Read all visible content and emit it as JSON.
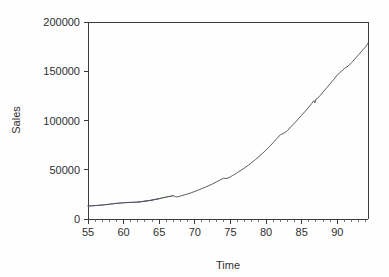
{
  "chart_data": {
    "type": "line",
    "title": "",
    "xlabel": "Time",
    "ylabel": "Sales",
    "xlim": [
      55,
      94.3
    ],
    "ylim": [
      0,
      200000
    ],
    "grid": false,
    "legend": "none",
    "x_ticks": [
      55,
      60,
      65,
      70,
      75,
      80,
      85,
      90
    ],
    "x_tick_labels": [
      "55",
      "60",
      "65",
      "70",
      "75",
      "80",
      "85",
      "90"
    ],
    "x_minor_tick_step": 1,
    "y_ticks": [
      0,
      50000,
      100000,
      150000,
      200000
    ],
    "y_tick_labels": [
      "0",
      "50000",
      "100000",
      "150000",
      "200000"
    ],
    "series": [
      {
        "name": "Sales",
        "color": "#4a4a4a",
        "x": [
          55,
          55.5,
          56,
          56.5,
          57,
          57.5,
          58,
          58.5,
          59,
          59.5,
          60,
          60.5,
          61,
          61.5,
          62,
          62.5,
          63,
          63.5,
          64,
          64.5,
          65,
          65.5,
          66,
          66.5,
          67,
          67.3,
          67.6,
          68,
          68.5,
          69,
          69.5,
          70,
          70.5,
          71,
          71.5,
          72,
          72.5,
          73,
          73.5,
          74,
          74.5,
          75,
          75.3,
          75.6,
          76,
          76.5,
          77,
          77.5,
          78,
          78.5,
          79,
          79.5,
          80,
          80.5,
          81,
          81.5,
          82,
          82.5,
          83,
          83.5,
          84,
          84.5,
          85,
          85.5,
          86,
          86.4,
          86.7,
          86.85,
          87,
          87.2,
          87.6,
          88,
          88.5,
          89,
          89.5,
          90,
          90.3,
          90.6,
          91,
          91.5,
          92,
          92.5,
          93,
          93.5,
          94,
          94.3
        ],
        "y": [
          13200,
          13400,
          13600,
          13900,
          14200,
          14600,
          15000,
          15400,
          15900,
          16200,
          16500,
          16700,
          16900,
          17000,
          17200,
          17600,
          18100,
          18600,
          19200,
          19900,
          20700,
          21500,
          22300,
          23000,
          23600,
          22600,
          22400,
          23400,
          24400,
          25500,
          26700,
          28000,
          29400,
          30900,
          32400,
          34000,
          35700,
          37500,
          39400,
          41300,
          41200,
          42800,
          44200,
          45300,
          47300,
          49600,
          52000,
          54600,
          57400,
          60300,
          63400,
          66700,
          70200,
          73800,
          77600,
          81600,
          85500,
          87200,
          89800,
          93800,
          97500,
          101400,
          105400,
          109500,
          113700,
          117300,
          120200,
          118000,
          121700,
          122300,
          125500,
          129000,
          133200,
          137500,
          141800,
          146200,
          148400,
          150100,
          152800,
          155200,
          158800,
          162800,
          166900,
          171100,
          175200,
          178400
        ]
      },
      {
        "name": "Overlay A",
        "color": "#6a6ab0",
        "x": [
          55,
          56,
          57,
          58,
          59,
          60,
          61,
          62,
          63,
          64,
          65
        ],
        "y": [
          13200,
          13600,
          14200,
          15000,
          15900,
          16500,
          16900,
          17200,
          18100,
          19200,
          20700
        ]
      },
      {
        "name": "Overlay B",
        "color": "#6f9f6f",
        "x": [
          62,
          63,
          64,
          65,
          66,
          67
        ],
        "y": [
          17200,
          18100,
          19200,
          20700,
          22300,
          23600
        ]
      }
    ]
  },
  "labels": {
    "y_axis_title": "Sales",
    "x_axis_title": "Time"
  }
}
